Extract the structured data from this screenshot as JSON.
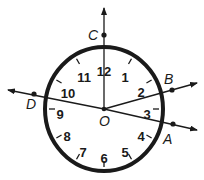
{
  "diagram": {
    "type": "clock-face-with-rays",
    "center": {
      "label": "O",
      "x": 104,
      "y": 109
    },
    "circle": {
      "rx": 59,
      "ry": 62,
      "stroke": "#1a1a1a",
      "stroke_width": 4
    },
    "clock_numbers": [
      {
        "value": "12",
        "x": 104,
        "y": 71
      },
      {
        "value": "1",
        "x": 125,
        "y": 77
      },
      {
        "value": "2",
        "x": 141,
        "y": 92
      },
      {
        "value": "3",
        "x": 147,
        "y": 114
      },
      {
        "value": "4",
        "x": 141,
        "y": 136
      },
      {
        "value": "5",
        "x": 125,
        "y": 152
      },
      {
        "value": "6",
        "x": 104,
        "y": 158
      },
      {
        "value": "7",
        "x": 83,
        "y": 152
      },
      {
        "value": "8",
        "x": 67,
        "y": 136
      },
      {
        "value": "9",
        "x": 60,
        "y": 114
      },
      {
        "value": "10",
        "x": 68,
        "y": 93
      },
      {
        "value": "11",
        "x": 84,
        "y": 77
      }
    ],
    "rays": [
      {
        "name": "OC",
        "point_label": "C",
        "dot": {
          "x": 104,
          "y": 35
        },
        "tip": {
          "x": 104,
          "y": 8
        },
        "label_pos": {
          "x": 92,
          "y": 40
        }
      },
      {
        "name": "OB",
        "point_label": "B",
        "dot": {
          "x": 172,
          "y": 90
        },
        "tip": {
          "x": 197,
          "y": 83
        },
        "label_pos": {
          "x": 165,
          "y": 82
        }
      },
      {
        "name": "OA",
        "point_label": "A",
        "dot": {
          "x": 173,
          "y": 124
        },
        "tip": {
          "x": 197,
          "y": 130
        },
        "label_pos": {
          "x": 164,
          "y": 144
        }
      },
      {
        "name": "OD",
        "point_label": "D",
        "dot": {
          "x": 34,
          "y": 94
        },
        "tip": {
          "x": 8,
          "y": 90
        },
        "label_pos": {
          "x": 26,
          "y": 107
        }
      }
    ],
    "labels": {
      "A": "A",
      "B": "B",
      "C": "C",
      "D": "D",
      "O": "O"
    }
  }
}
